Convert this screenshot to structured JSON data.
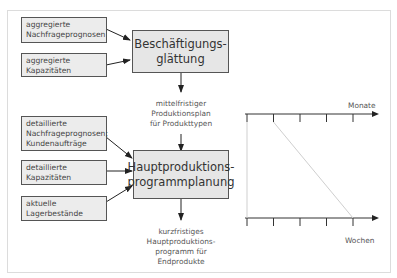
{
  "diagram": {
    "top_inputs": [
      {
        "lines": [
          "aggregierte",
          "Nachfrageprognosen"
        ]
      },
      {
        "lines": [
          "aggregierte",
          "Kapazitäten"
        ]
      }
    ],
    "top_process": {
      "lines": [
        "Beschäftigungs-",
        "glättung"
      ]
    },
    "middle_output": {
      "lines": [
        "mittelfristiger",
        "Produktionsplan",
        "für Produkttypen"
      ]
    },
    "bottom_inputs": [
      {
        "lines": [
          "detaillierte",
          "Nachfrageprognosen;",
          "Kundenaufträge"
        ]
      },
      {
        "lines": [
          "detaillierte",
          "Kapazitäten"
        ]
      },
      {
        "lines": [
          "aktuelle",
          "Lagerbestände"
        ]
      }
    ],
    "bottom_process": {
      "lines": [
        "Hauptproduktions-",
        "programmplanung"
      ]
    },
    "final_output": {
      "lines": [
        "kurzfristiges",
        "Hauptproduktions-",
        "programm für",
        "Endprodukte"
      ]
    },
    "timeline": {
      "top_axis_label": "Monate",
      "bottom_axis_label": "Wochen",
      "top_tick_count": 5,
      "bottom_tick_count": 5
    }
  }
}
